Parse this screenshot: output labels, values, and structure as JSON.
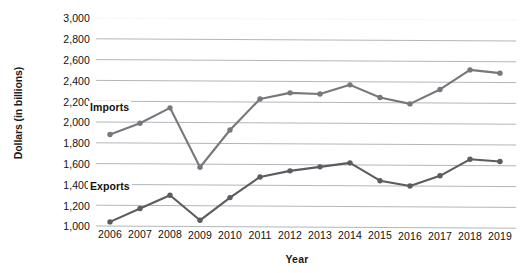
{
  "chart_data": {
    "type": "line",
    "title": "",
    "xlabel": "Year",
    "ylabel": "Dollars (in billions)",
    "x": [
      2006,
      2007,
      2008,
      2009,
      2010,
      2011,
      2012,
      2013,
      2014,
      2015,
      2016,
      2017,
      2018,
      2019
    ],
    "xticklabels": [
      "2006",
      "2007",
      "2008",
      "2009",
      "2010",
      "2011",
      "2012",
      "2013",
      "2014",
      "2015",
      "2016",
      "2017",
      "2018",
      "2019"
    ],
    "yticklabels": [
      "3,000",
      "2,800",
      "2,600",
      "2,400",
      "2,200",
      "2,000",
      "1,800",
      "1,600",
      "1,400",
      "1,200",
      "1,000"
    ],
    "ylim": [
      1000,
      3000
    ],
    "ytick_step": 200,
    "grid": "horizontal",
    "legend": "inline-series-labels",
    "series": [
      {
        "name": "Imports",
        "color": "#76787c",
        "values": [
          1880,
          1990,
          2140,
          1570,
          1930,
          2230,
          2290,
          2280,
          2370,
          2250,
          2190,
          2330,
          2520,
          2490
        ]
      },
      {
        "name": "Exports",
        "color": "#5a5c60",
        "values": [
          1040,
          1170,
          1300,
          1060,
          1280,
          1480,
          1540,
          1580,
          1620,
          1450,
          1400,
          1500,
          1660,
          1640
        ]
      }
    ]
  },
  "axes": {
    "y_title": "Dollars (in billions)",
    "x_title": "Year"
  },
  "labels": {
    "imports": "Imports",
    "exports": "Exports"
  },
  "colors": {
    "imports_line": "#76787c",
    "exports_line": "#5a5c60",
    "gridline": "#9aa0a6",
    "text": "#111111"
  }
}
